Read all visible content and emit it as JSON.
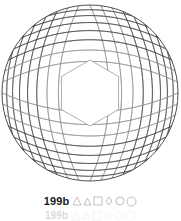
{
  "plate": {
    "caption_label": "199b",
    "figure_title": "199b",
    "figure_type": "curvilinear-arc-lattice",
    "background_color": "#ffffff"
  },
  "figure": {
    "name": "circular arc lattice",
    "boundary_shape": "circle",
    "center_x": 90,
    "center_y": 93,
    "radius": 88,
    "center_void_shape": "hexagon",
    "center_void_radius": 33,
    "line_color": "#3c3c3c",
    "line_color_light": "#8c8c8c",
    "line_width": 0.6,
    "boundary_line_width": 0.9,
    "arc_family_count": 2,
    "arcs_per_family": 17,
    "arc_bulge": 0.62,
    "family_a_rotation_deg": 0,
    "family_b_rotation_deg": 90,
    "grid_extent": 1.0
  },
  "glyphs": {
    "color": "#b8b8b8",
    "items": [
      {
        "name": "triangle-icon",
        "shape": "triangle",
        "size": 8
      },
      {
        "name": "triangle-small-icon",
        "shape": "triangle",
        "size": 7
      },
      {
        "name": "square-icon",
        "shape": "square",
        "size": 8
      },
      {
        "name": "diamond-icon",
        "shape": "diamond",
        "size": 8
      },
      {
        "name": "circle-icon",
        "shape": "circle",
        "size": 8
      },
      {
        "name": "circle-large-icon",
        "shape": "circle",
        "size": 9
      }
    ]
  },
  "ghost": {
    "caption_label": "199b",
    "visible": true
  }
}
